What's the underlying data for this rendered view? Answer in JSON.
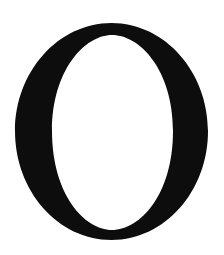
{
  "glyph": {
    "character": "O",
    "color": "#0d0d0d",
    "background": "#ffffff"
  }
}
